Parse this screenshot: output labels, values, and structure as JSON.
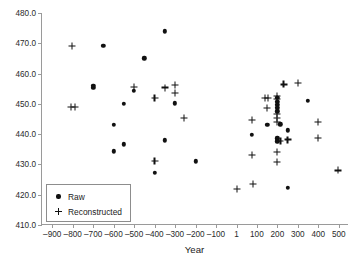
{
  "chart_data": {
    "type": "scatter",
    "title": "",
    "xlabel": "Year",
    "ylabel": "",
    "xlim": [
      -950,
      550
    ],
    "ylim": [
      410,
      480
    ],
    "grid": false,
    "legend_position": "bottom-left",
    "x_ticks": [
      -900,
      -800,
      -700,
      -600,
      -500,
      -400,
      -300,
      -200,
      -100,
      1,
      100,
      200,
      300,
      400,
      500
    ],
    "x_tick_labels": [
      "–900",
      "–800",
      "–700",
      "–600",
      "–500",
      "–400",
      "–300",
      "–200",
      "–100",
      "1",
      "100",
      "200",
      "300",
      "400",
      "500"
    ],
    "y_ticks": [
      410,
      420,
      430,
      440,
      450,
      460,
      470,
      480
    ],
    "y_tick_labels": [
      "410.0",
      "420.0",
      "430.0",
      "440.0",
      "450.0",
      "460.0",
      "470.0",
      "480.0"
    ],
    "marker_color": "#111111",
    "series": [
      {
        "name": "Raw",
        "marker": "circle",
        "points": [
          [
            -650,
            469.1
          ],
          [
            -700,
            455.9
          ],
          [
            -700,
            455.2
          ],
          [
            -600,
            443.0
          ],
          [
            -600,
            434.3
          ],
          [
            -550,
            450.1
          ],
          [
            -550,
            436.7
          ],
          [
            -500,
            454.3
          ],
          [
            -450,
            465.0
          ],
          [
            -400,
            427.2
          ],
          [
            -350,
            474.0
          ],
          [
            -350,
            438.0
          ],
          [
            -300,
            450.2
          ],
          [
            -200,
            431.0
          ],
          [
            75,
            439.8
          ],
          [
            150,
            443.0
          ],
          [
            200,
            452.0
          ],
          [
            200,
            450.6
          ],
          [
            200,
            449.6
          ],
          [
            200,
            448.6
          ],
          [
            200,
            447.6
          ],
          [
            200,
            438.6
          ],
          [
            200,
            437.6
          ],
          [
            215,
            443.3
          ],
          [
            250,
            441.3
          ],
          [
            250,
            422.3
          ],
          [
            350,
            451.0
          ]
        ]
      },
      {
        "name": "Reconstructed",
        "marker": "plus",
        "points": [
          [
            -805,
            469.1
          ],
          [
            -810,
            449.0
          ],
          [
            -790,
            449.0
          ],
          [
            -500,
            455.6
          ],
          [
            -400,
            452.0
          ],
          [
            -400,
            431.0
          ],
          [
            -350,
            455.4
          ],
          [
            -300,
            456.1
          ],
          [
            -300,
            453.6
          ],
          [
            -255,
            445.3
          ],
          [
            1,
            421.9
          ],
          [
            75,
            444.6
          ],
          [
            75,
            433.0
          ],
          [
            80,
            423.6
          ],
          [
            140,
            452.0
          ],
          [
            155,
            452.0
          ],
          [
            150,
            448.6
          ],
          [
            200,
            452.6
          ],
          [
            200,
            451.6
          ],
          [
            200,
            446.6
          ],
          [
            200,
            445.3
          ],
          [
            200,
            444.0
          ],
          [
            200,
            434.0
          ],
          [
            200,
            430.9
          ],
          [
            215,
            437.7
          ],
          [
            230,
            456.4
          ],
          [
            250,
            438.2
          ],
          [
            300,
            456.9
          ],
          [
            400,
            444.0
          ],
          [
            400,
            438.8
          ],
          [
            495,
            428.0
          ]
        ]
      }
    ]
  },
  "legend": {
    "entries": [
      {
        "label": "Raw",
        "marker": "dot"
      },
      {
        "label": "Reconstructed",
        "marker": "plus"
      }
    ]
  }
}
